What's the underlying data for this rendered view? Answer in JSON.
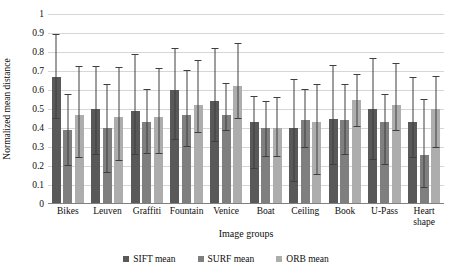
{
  "chart_data": {
    "type": "bar",
    "title": "",
    "xlabel": "Image groups",
    "ylabel": "Normalized mean distance",
    "ylim": [
      0,
      1
    ],
    "grid": true,
    "legend_position": "bottom",
    "ytick_labels": [
      "1",
      "0.9",
      "0.8",
      "0.7",
      "0.6",
      "0.5",
      "0.4",
      "0.3",
      "0.2",
      "0.1",
      "0"
    ],
    "ytick_values": [
      1,
      0.9,
      0.8,
      0.7,
      0.6,
      0.5,
      0.4,
      0.3,
      0.2,
      0.1,
      0
    ],
    "categories": [
      "Bikes",
      "Leuven",
      "Graffiti",
      "Fountain",
      "Venice",
      "Boat",
      "Ceiling",
      "Book",
      "U-Pass",
      "Heart shape"
    ],
    "series": [
      {
        "name": "SIFT mean",
        "color": "#595959",
        "values": [
          0.67,
          0.5,
          0.49,
          0.6,
          0.54,
          0.43,
          0.4,
          0.45,
          0.5,
          0.43
        ],
        "err_low": [
          0.445,
          0.26,
          0.26,
          0.335,
          0.325,
          0.185,
          0.115,
          0.205,
          0.23,
          0.24
        ],
        "err_high": [
          0.89,
          0.72,
          0.785,
          0.815,
          0.815,
          0.565,
          0.655,
          0.725,
          0.765,
          0.665
        ]
      },
      {
        "name": "SURF mean",
        "color": "#7f7f7f",
        "values": [
          0.39,
          0.4,
          0.43,
          0.47,
          0.47,
          0.4,
          0.44,
          0.44,
          0.43,
          0.26
        ],
        "err_low": [
          0.2,
          0.165,
          0.265,
          0.3,
          0.385,
          0.245,
          0.295,
          0.26,
          0.205,
          0.085
        ],
        "err_high": [
          0.575,
          0.625,
          0.6,
          0.7,
          0.63,
          0.535,
          0.6,
          0.625,
          0.575,
          0.545
        ]
      },
      {
        "name": "ORB mean",
        "color": "#adadad",
        "values": [
          0.47,
          0.46,
          0.46,
          0.52,
          0.62,
          0.4,
          0.43,
          0.55,
          0.52,
          0.5
        ],
        "err_low": [
          0.24,
          0.225,
          0.265,
          0.375,
          0.445,
          0.245,
          0.155,
          0.405,
          0.385,
          0.295
        ],
        "err_high": [
          0.72,
          0.715,
          0.71,
          0.755,
          0.84,
          0.56,
          0.625,
          0.68,
          0.735,
          0.67
        ]
      }
    ]
  },
  "legend": {
    "items": [
      {
        "label": "SIFT mean",
        "color": "#595959"
      },
      {
        "label": "SURF mean",
        "color": "#7f7f7f"
      },
      {
        "label": "ORB mean",
        "color": "#adadad"
      }
    ]
  }
}
